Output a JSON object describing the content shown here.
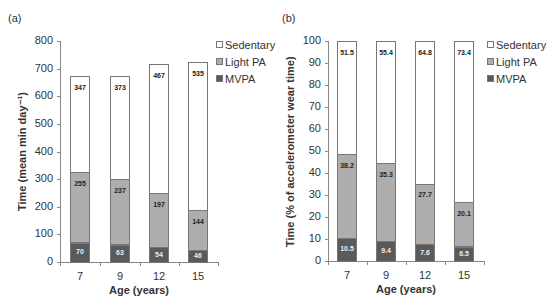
{
  "chart_data": [
    {
      "type": "bar",
      "stacked": true,
      "panel_label": "(a)",
      "title": "",
      "xlabel": "Age (years)",
      "ylabel": "Time (mean min day⁻¹)",
      "categories": [
        "7",
        "9",
        "12",
        "15"
      ],
      "yticks": [
        "0",
        "100",
        "200",
        "300",
        "400",
        "500",
        "600",
        "700",
        "800"
      ],
      "ylim": [
        0,
        800
      ],
      "grid": false,
      "legend_position": "right-top",
      "series": [
        {
          "name": "MVPA",
          "color": "#5a5a5a",
          "values": [
            70,
            63,
            54,
            46
          ],
          "labels": [
            "70",
            "63",
            "54",
            "46"
          ]
        },
        {
          "name": "Light PA",
          "color": "#aeaeae",
          "values": [
            255,
            237,
            197,
            144
          ],
          "labels": [
            "255",
            "237",
            "197",
            "144"
          ]
        },
        {
          "name": "Sedentary",
          "color": "#ffffff",
          "values": [
            347,
            373,
            467,
            535
          ],
          "labels": [
            "347",
            "373",
            "467",
            "535"
          ]
        }
      ],
      "legend": [
        "Sedentary",
        "Light PA",
        "MVPA"
      ]
    },
    {
      "type": "bar",
      "stacked": true,
      "panel_label": "(b)",
      "title": "",
      "xlabel": "Age (years)",
      "ylabel": "Time (% of accelerometer wear time)",
      "categories": [
        "7",
        "9",
        "12",
        "15"
      ],
      "yticks": [
        "0",
        "10",
        "20",
        "30",
        "40",
        "50",
        "60",
        "70",
        "80",
        "90",
        "100"
      ],
      "ylim": [
        0,
        100
      ],
      "grid": false,
      "legend_position": "right-top",
      "series": [
        {
          "name": "MVPA",
          "color": "#5a5a5a",
          "values": [
            10.5,
            9.4,
            7.6,
            6.5
          ],
          "labels": [
            "10.5",
            "9.4",
            "7.6",
            "6.5"
          ]
        },
        {
          "name": "Light PA",
          "color": "#aeaeae",
          "values": [
            38.2,
            35.3,
            27.7,
            20.1
          ],
          "labels": [
            "38.2",
            "35.3",
            "27.7",
            "20.1"
          ]
        },
        {
          "name": "Sedentary",
          "color": "#ffffff",
          "values": [
            51.5,
            55.4,
            64.8,
            73.4
          ],
          "labels": [
            "51.5",
            "55.4",
            "64.8",
            "73.4"
          ]
        }
      ],
      "legend": [
        "Sedentary",
        "Light PA",
        "MVPA"
      ]
    }
  ]
}
